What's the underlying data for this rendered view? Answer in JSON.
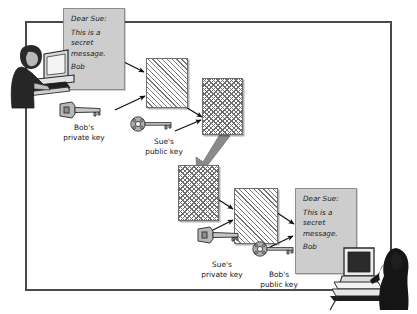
{
  "diagram": {
    "frame": {
      "label": "diagram-border"
    },
    "colors": {
      "note_background": "#cdcdcd",
      "note_border": "#8d8d8d",
      "frame_border": "#4a4a4a",
      "hatch_ink": "#6e6e6e",
      "arrow_thin": "#111111",
      "arrow_thick": "#8a8a8a",
      "figure_ink": "#1c1c1c",
      "page_background": "#ffffff"
    },
    "message": {
      "salutation": "Dear Sue:",
      "body_line_1": "This is a",
      "body_line_2": "secret",
      "body_line_3": "message.",
      "signature": "Bob"
    },
    "notes": [
      {
        "id": "note-top",
        "name": "plaintext-message-sender",
        "position": "top-left"
      },
      {
        "id": "note-bot",
        "name": "plaintext-message-recipient",
        "position": "bottom-right"
      }
    ],
    "documents": [
      {
        "id": "doc-signed",
        "name": "signed-message",
        "pattern": "diagonal-stripe",
        "stage": 1
      },
      {
        "id": "doc-enc",
        "name": "signed-encrypted-message",
        "pattern": "cross-hatch",
        "stage": 2
      },
      {
        "id": "doc-enc2",
        "name": "received-encrypted-message",
        "pattern": "cross-hatch",
        "stage": 3
      },
      {
        "id": "doc-signed2",
        "name": "decrypted-signed-message",
        "pattern": "diagonal-stripe",
        "stage": 4
      }
    ],
    "keys": [
      {
        "id": "key-bobpriv",
        "line1": "Bob's",
        "line2": "private key",
        "style": "chunky",
        "owner": "Bob",
        "kind": "private"
      },
      {
        "id": "key-suepub",
        "line1": "Sue's",
        "line2": "public key",
        "style": "skeleton",
        "owner": "Sue",
        "kind": "public"
      },
      {
        "id": "key-suepriv",
        "line1": "Sue's",
        "line2": "private key",
        "style": "chunky",
        "owner": "Sue",
        "kind": "private"
      },
      {
        "id": "key-bobpub",
        "line1": "Bob's",
        "line2": "public key",
        "style": "skeleton",
        "owner": "Bob",
        "kind": "public"
      }
    ],
    "people": [
      {
        "id": "person-bob",
        "name": "sender-at-computer",
        "facing": "right"
      },
      {
        "id": "person-sue",
        "name": "recipient-at-computer",
        "facing": "left"
      }
    ],
    "arrows": [
      {
        "name": "note-to-signed-doc",
        "type": "thin"
      },
      {
        "name": "bob-private-key-to-sign",
        "type": "thin"
      },
      {
        "name": "signed-doc-to-encrypted",
        "type": "thin"
      },
      {
        "name": "sue-public-key-to-encrypt",
        "type": "thin"
      },
      {
        "name": "transmission-arrow",
        "type": "thick"
      },
      {
        "name": "encrypted-to-decrypted",
        "type": "thin"
      },
      {
        "name": "sue-private-key-to-decrypt",
        "type": "thin"
      },
      {
        "name": "decrypted-to-plaintext",
        "type": "thin"
      },
      {
        "name": "bob-public-key-to-verify",
        "type": "thin"
      }
    ]
  }
}
